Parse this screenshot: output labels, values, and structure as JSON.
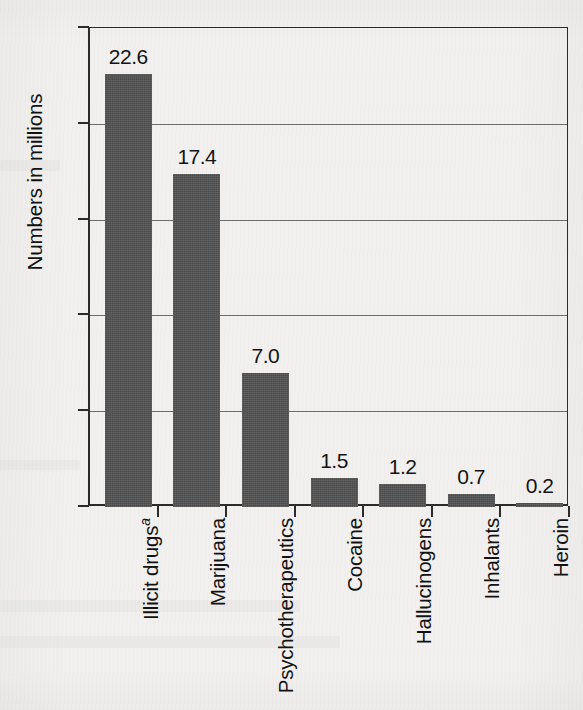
{
  "chart_data": {
    "type": "bar",
    "title": "",
    "subtitle": "",
    "xlabel": "",
    "ylabel": "Numbers in millions",
    "ylim": [
      0,
      25
    ],
    "yticks": [
      0,
      5,
      10,
      15,
      20,
      25
    ],
    "ytick_labels": [
      "0",
      "5",
      "10",
      "15",
      "20",
      "25"
    ],
    "grid": true,
    "grid_axis": "y",
    "legend": false,
    "legend_position": "none",
    "bar_color": "#4b4b4b",
    "axis_color": "#2b2b2b",
    "background_color": "#f1f0ee",
    "categories": [
      "Illicit drugs",
      "Marijuana",
      "Psychotherapeutics",
      "Cocaine",
      "Hallucinogens",
      "Inhalants",
      "Heroin"
    ],
    "category_superscripts": [
      "a",
      "",
      "",
      "",
      "",
      "",
      ""
    ],
    "values": [
      22.6,
      17.4,
      7.0,
      1.5,
      1.2,
      0.7,
      0.2
    ],
    "value_labels": [
      "22.6",
      "17.4",
      "7.0",
      "1.5",
      "1.2",
      "0.7",
      "0.2"
    ],
    "units": "millions"
  }
}
